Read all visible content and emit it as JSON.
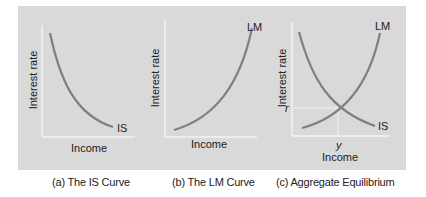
{
  "figure": {
    "background_color": "#d9d9d9",
    "curve_color": "#7f7f7f",
    "axis_color": "#f2f2f2",
    "panels": [
      {
        "id": "a",
        "caption": "(a) The IS Curve",
        "ylabel": "Interest rate",
        "xlabel": "Income",
        "curves": [
          {
            "label": "IS",
            "shape": "downward-sloping convex"
          }
        ]
      },
      {
        "id": "b",
        "caption": "(b) The LM Curve",
        "ylabel": "Interest rate",
        "xlabel": "Income",
        "curves": [
          {
            "label": "LM",
            "shape": "upward-sloping convex"
          }
        ]
      },
      {
        "id": "c",
        "caption": "(c) Aggregate Equilibrium",
        "ylabel": "Interest rate",
        "xlabel": "Income",
        "curves": [
          {
            "label": "LM",
            "shape": "upward-sloping convex"
          },
          {
            "label": "IS",
            "shape": "downward-sloping convex"
          }
        ],
        "equilibrium": {
          "r_label": "r",
          "y_label": "y"
        }
      }
    ]
  }
}
